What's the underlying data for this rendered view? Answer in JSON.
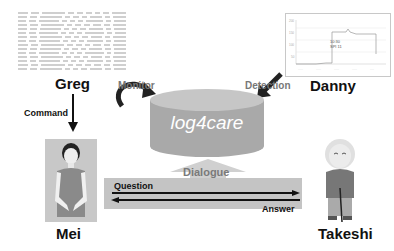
{
  "diagram": {
    "title": "log4care",
    "nodes": {
      "greg": {
        "name": "Greg",
        "role_image": "log-table"
      },
      "danny": {
        "name": "Danny",
        "role_image": "line-chart"
      },
      "mei": {
        "name": "Mei",
        "role_image": "female-avatar"
      },
      "takeshi": {
        "name": "Takeshi",
        "role_image": "elderly-man-avatar"
      },
      "database": {
        "label": "log4care"
      }
    },
    "edges": {
      "monitor": "Monitor",
      "detection": "Detection",
      "command": "Command",
      "dialogue": "Dialogue",
      "question": "Question",
      "answer": "Answer"
    },
    "chart_annotation": {
      "line1": "10:30",
      "line2": "SPI 11"
    },
    "colors": {
      "cylinder": "#a9a9a9",
      "cylinder_top": "#c6c6c6",
      "band": "#c4c4c4",
      "text_dark": "#111111",
      "text_grey": "#777777"
    }
  }
}
